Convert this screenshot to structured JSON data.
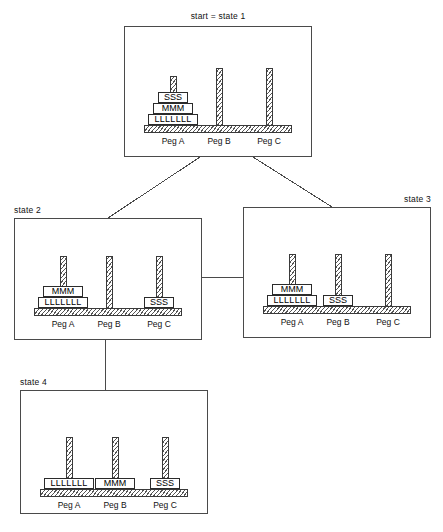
{
  "diagram": {
    "title_text": "start = state 1",
    "width": 443,
    "height": 532,
    "line_color": "#4a4a4a",
    "ink_color": "#1a1a1a"
  },
  "pegs": {
    "peg_a_label": "Peg A",
    "peg_b_label": "Peg B",
    "peg_c_label": "Peg C"
  },
  "discs": {
    "large": "LLLLLLL",
    "medium": "MMM",
    "small": "SSS"
  },
  "states": [
    {
      "id": "state-1",
      "label": "start = state 1",
      "label_align": "center",
      "box": {
        "x": 124,
        "y": 26,
        "w": 188,
        "h": 131
      },
      "pegs": [
        {
          "name": "Peg A",
          "discs": [
            "LLLLLLL",
            "MMM",
            "SSS"
          ]
        },
        {
          "name": "Peg B",
          "discs": []
        },
        {
          "name": "Peg C",
          "discs": []
        }
      ]
    },
    {
      "id": "state-2",
      "label": "state 2",
      "label_align": "left",
      "box": {
        "x": 14,
        "y": 218,
        "w": 188,
        "h": 122
      },
      "pegs": [
        {
          "name": "Peg A",
          "discs": [
            "LLLLLLL",
            "MMM"
          ]
        },
        {
          "name": "Peg B",
          "discs": []
        },
        {
          "name": "Peg C",
          "discs": [
            "SSS"
          ]
        }
      ]
    },
    {
      "id": "state-3",
      "label": "state 3",
      "label_align": "right",
      "box": {
        "x": 243,
        "y": 207,
        "w": 188,
        "h": 131
      },
      "pegs": [
        {
          "name": "Peg A",
          "discs": [
            "LLLLLLL",
            "MMM"
          ]
        },
        {
          "name": "Peg B",
          "discs": [
            "SSS"
          ]
        },
        {
          "name": "Peg C",
          "discs": []
        }
      ]
    },
    {
      "id": "state-4",
      "label": "state 4",
      "label_align": "left",
      "box": {
        "x": 20,
        "y": 390,
        "w": 188,
        "h": 124
      },
      "pegs": [
        {
          "name": "Peg A",
          "discs": [
            "LLLLLLL"
          ]
        },
        {
          "name": "Peg B",
          "discs": [
            "MMM"
          ]
        },
        {
          "name": "Peg C",
          "discs": [
            "SSS"
          ]
        }
      ]
    }
  ],
  "edges": [
    {
      "id": "edge-state1-state2",
      "from": "state 1",
      "to": "state 2",
      "points": "200,157 108,218"
    },
    {
      "id": "edge-state1-state3",
      "from": "state 1",
      "to": "state 3",
      "points": "253,157 332,207"
    },
    {
      "id": "edge-state2-state3",
      "from": "state 2",
      "to": "state 3",
      "points": "202,277 243,277"
    },
    {
      "id": "edge-state2-state4",
      "from": "state 2",
      "to": "state 4",
      "points": "105,340 105,390"
    }
  ]
}
